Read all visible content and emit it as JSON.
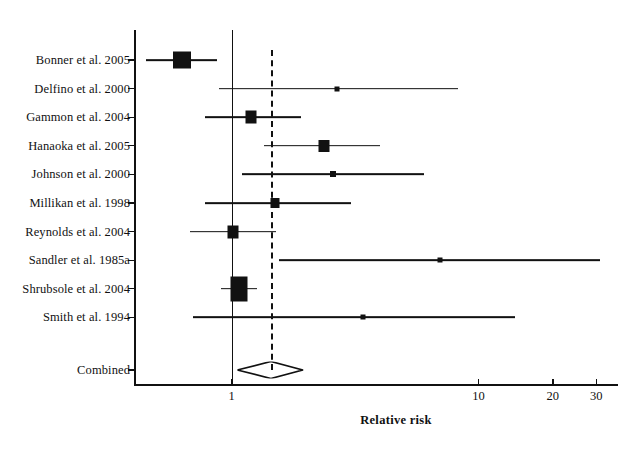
{
  "chart_data": {
    "type": "forest",
    "title": "",
    "xlabel": "Relative risk",
    "ylabel": "",
    "scale": "log",
    "xlim": [
      0.42,
      42
    ],
    "xticks": [
      1,
      10,
      20,
      30
    ],
    "xticklabels": [
      "1",
      "10",
      "20",
      "30"
    ],
    "grid": false,
    "legend": "none",
    "reference_line": 1,
    "pooled_line": 1.45,
    "categories": [
      "Bonner et al. 2005",
      "Delfino et al. 2000",
      "Gammon et al. 2004",
      "Hanaoka et al. 2005",
      "Johnson et al. 2000",
      "Millikan et al. 1998",
      "Reynolds et al. 2004",
      "Sandler et al. 1985a",
      "Shrubsole et al. 2004",
      "Smith et al. 1994"
    ],
    "studies": [
      {
        "label": "Bonner et al. 2005",
        "rr": 0.63,
        "ci_low": 0.45,
        "ci_high": 0.87,
        "marker": "box",
        "box_w": 18,
        "box_h": 17
      },
      {
        "label": "Delfino et al. 2000",
        "rr": 2.68,
        "ci_low": 0.89,
        "ci_high": 8.3,
        "marker": "point",
        "box_w": 5,
        "box_h": 5
      },
      {
        "label": "Gammon et al. 2004",
        "rr": 1.2,
        "ci_low": 0.78,
        "ci_high": 1.92,
        "marker": "box",
        "box_w": 11,
        "box_h": 13
      },
      {
        "label": "Hanaoka et al. 2005",
        "rr": 2.36,
        "ci_low": 1.35,
        "ci_high": 4.0,
        "marker": "box",
        "box_w": 11,
        "box_h": 12
      },
      {
        "label": "Johnson et al. 2000",
        "rr": 2.58,
        "ci_low": 1.1,
        "ci_high": 6.0,
        "marker": "point",
        "box_w": 6,
        "box_h": 6
      },
      {
        "label": "Millikan et al. 1998",
        "rr": 1.5,
        "ci_low": 0.78,
        "ci_high": 3.05,
        "marker": "box",
        "box_w": 9,
        "box_h": 10
      },
      {
        "label": "Reynolds et al. 2004",
        "rr": 1.01,
        "ci_low": 0.68,
        "ci_high": 1.52,
        "marker": "box",
        "box_w": 11,
        "box_h": 13
      },
      {
        "label": "Sandler et al. 1985a",
        "rr": 7.0,
        "ci_low": 1.55,
        "ci_high": 31.0,
        "marker": "point",
        "box_w": 5,
        "box_h": 5
      },
      {
        "label": "Shrubsole et al. 2004",
        "rr": 1.07,
        "ci_low": 0.91,
        "ci_high": 1.27,
        "marker": "box",
        "box_w": 17,
        "box_h": 25
      },
      {
        "label": "Smith et al. 1994",
        "rr": 3.4,
        "ci_low": 0.7,
        "ci_high": 14.0,
        "marker": "point",
        "box_w": 5,
        "box_h": 5
      }
    ],
    "combined": {
      "label": "Combined",
      "rr": 1.45,
      "ci_low": 1.06,
      "ci_high": 1.95,
      "marker": "diamond"
    },
    "colors": {
      "marker": "#111111",
      "line": "#111111",
      "reference": "#111111",
      "pooled": "#111111",
      "background": "#ffffff"
    }
  }
}
